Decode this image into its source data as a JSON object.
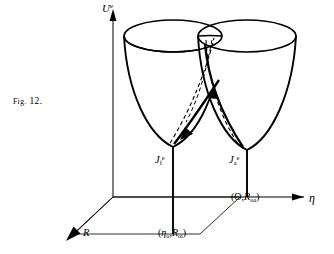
{
  "figure": {
    "caption_prefix": "Fig.",
    "caption_number": "12.",
    "caption_full": "Fig. 12.",
    "background_color": "#ffffff",
    "ink_color": "#000000"
  },
  "axes": {
    "vertical": {
      "name": "U-axis",
      "symbol": "U",
      "superscript": "e",
      "label": "Uᵉ",
      "arrow": "up"
    },
    "horizontal": {
      "name": "eta-axis",
      "symbol": "η",
      "label": "η",
      "arrow": "right"
    },
    "depth": {
      "name": "R-axis",
      "symbol": "R",
      "label": "R",
      "arrow": "down-left"
    }
  },
  "wells": [
    {
      "id": "final-well",
      "name": "left-potential-well",
      "label_symbol": "J",
      "label_subscript": "f",
      "label_superscript": "e",
      "label": "Jₑᶠ",
      "coordinate_label": "(η₀,R₀ᵢ)",
      "coordinate_symbol": "η",
      "coordinate_subscript_1": "o",
      "coordinate_symbol_2": "R",
      "coordinate_subscript_2": "oi"
    },
    {
      "id": "acceptor-well",
      "name": "right-potential-well",
      "label_symbol": "J",
      "label_subscript": "a",
      "label_superscript": "e",
      "label": "Jₐᵉ",
      "coordinate_label": "(O,R₀ₐ)",
      "coordinate_symbol_1": "O",
      "coordinate_symbol_2": "R",
      "coordinate_subscript_2": "oa"
    }
  ],
  "trajectories": {
    "name": "crossing-trajectories",
    "count": 2,
    "style_solid": "solid-arrowed-path",
    "style_dashed": "dashed-guide-path",
    "arrow_count": 2
  }
}
